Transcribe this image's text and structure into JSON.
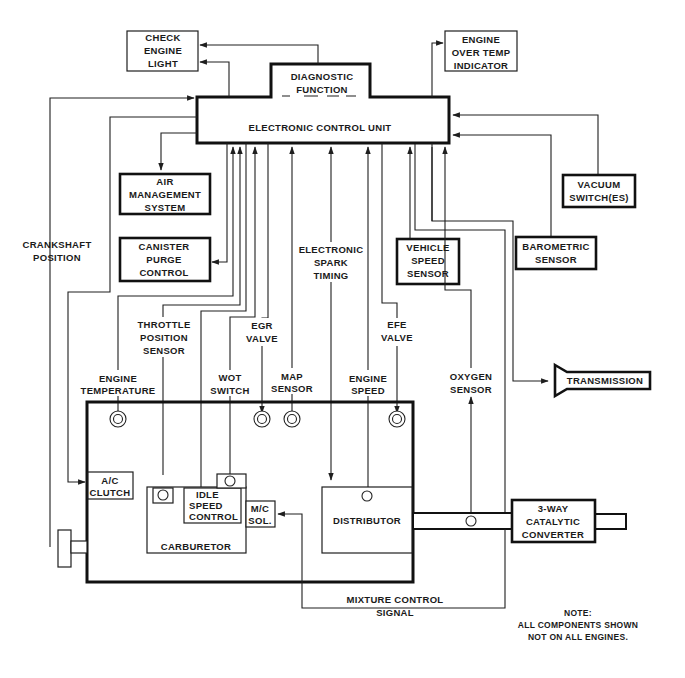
{
  "diagram": {
    "ecu": {
      "label": "ELECTRONIC CONTROL UNIT"
    },
    "diagnostic": {
      "line1": "DIAGNOSTIC",
      "line2": "FUNCTION"
    },
    "outputs": {
      "check_engine_light": [
        "CHECK",
        "ENGINE",
        "LIGHT"
      ],
      "engine_over_temp": [
        "ENGINE",
        "OVER TEMP",
        "INDICATOR"
      ],
      "air_management": [
        "AIR",
        "MANAGEMENT",
        "SYSTEM"
      ],
      "canister_purge": [
        "CANISTER",
        "PURGE",
        "CONTROL"
      ],
      "transmission": "TRANSMISSION"
    },
    "sensors": {
      "vacuum_switches": [
        "VACUUM",
        "SWITCH(ES)"
      ],
      "barometric": [
        "BAROMETRIC",
        "SENSOR"
      ],
      "vehicle_speed": [
        "VEHICLE",
        "SPEED",
        "SENSOR"
      ]
    },
    "signal_labels": {
      "crankshaft_position": [
        "CRANKSHAFT",
        "POSITION"
      ],
      "electronic_spark_timing": [
        "ELECTRONIC",
        "SPARK",
        "TIMING"
      ],
      "throttle_position": [
        "THROTTLE",
        "POSITION",
        "SENSOR"
      ],
      "egr_valve": [
        "EGR",
        "VALVE"
      ],
      "efe_valve": [
        "EFE",
        "VALVE"
      ],
      "engine_temperature": [
        "ENGINE",
        "TEMPERATURE"
      ],
      "wot_switch": [
        "WOT",
        "SWITCH"
      ],
      "map_sensor": [
        "MAP",
        "SENSOR"
      ],
      "engine_speed": [
        "ENGINE",
        "SPEED"
      ],
      "oxygen_sensor": [
        "OXYGEN",
        "SENSOR"
      ],
      "mixture_control": [
        "MIXTURE CONTROL",
        "SIGNAL"
      ]
    },
    "engine_components": {
      "ac_clutch": [
        "A/C",
        "CLUTCH"
      ],
      "idle_speed_control": [
        "IDLE",
        "SPEED",
        "CONTROL"
      ],
      "mc_sol": [
        "M/C",
        "SOL."
      ],
      "carburetor": "CARBURETOR",
      "distributor": "DISTRIBUTOR",
      "catalytic_converter": [
        "3-WAY",
        "CATALYTIC",
        "CONVERTER"
      ]
    },
    "note": [
      "NOTE:",
      "ALL COMPONENTS SHOWN",
      "NOT ON ALL ENGINES."
    ]
  }
}
